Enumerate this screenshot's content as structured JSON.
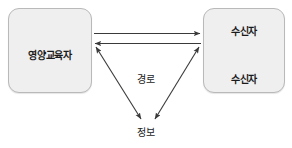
{
  "diagram": {
    "background_color": "#ffffff",
    "line_color": "#3a3a3a",
    "box_fill_color": "#efefef",
    "box_border_color": "#b9b9b9",
    "text_color": "#1a1a1a"
  },
  "nodes": {
    "educator": {
      "label": "영양교육자"
    },
    "receivers": {
      "top_label": "수신자",
      "bottom_label": "수신자"
    }
  },
  "labels": {
    "channel": "경로",
    "information": "정보"
  },
  "connectors": {
    "educator_to_receivers": "arrow-right",
    "receivers_to_educator": "arrow-left",
    "receiver_to_receiver": "double-arrow-vertical",
    "educator_to_information": "double-arrow-diagonal",
    "receivers_to_information": "double-arrow-diagonal"
  }
}
